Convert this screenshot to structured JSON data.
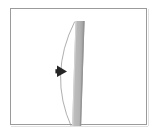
{
  "panel": {
    "background_color": "#ffffff",
    "border_color": "#9b9b9b"
  },
  "diagram": {
    "title": "",
    "beam": {
      "name": "vertical-bar",
      "fill_color": "#b7b7b7",
      "edge_color": "#8d8d8d",
      "highlight_color": "#d2d2d2",
      "x": 63,
      "y": 12,
      "width": 9,
      "height": 107,
      "tilt": "slightly leaning, top edge right of bottom edge"
    },
    "curve": {
      "name": "deflection-curve",
      "stroke_color": "#9a9a9a",
      "stroke_width": 0.7,
      "start": [
        63,
        13
      ],
      "control": [
        38,
        66
      ],
      "end": [
        60,
        118
      ]
    },
    "arrow_marker": {
      "name": "direction-arrow",
      "fill_color": "#262626",
      "direction": "right",
      "x": 45,
      "y": 57,
      "width": 9,
      "height": 10
    }
  },
  "colors": {
    "canvas": "#ffffff",
    "frame": "#9b9b9b",
    "bar": "#b7b7b7",
    "curve": "#9a9a9a",
    "arrow": "#262626"
  }
}
